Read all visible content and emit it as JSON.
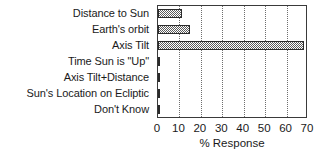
{
  "chart_data": {
    "type": "bar",
    "orientation": "horizontal",
    "title": "",
    "xlabel": "% Response",
    "ylabel": "",
    "categories": [
      "Distance to Sun",
      "Earth's orbit",
      "Axis Tilt",
      "Time Sun is \"Up\"",
      "Axis Tilt+Distance",
      "Sun's Location on Ecliptic",
      "Don't Know"
    ],
    "values": [
      11,
      15,
      68,
      0,
      0,
      0,
      0
    ],
    "xlim": [
      0,
      70
    ],
    "xticks": [
      0,
      10,
      20,
      30,
      40,
      50,
      60,
      70
    ],
    "xtick_labels": [
      "0",
      "10",
      "20",
      "30",
      "40",
      "50",
      "60",
      "70"
    ],
    "grid": "vertical-dotted",
    "legend": "none",
    "bar_fill": "#5b5b5b",
    "bar_edge": "#2b2b2b",
    "axis_color": "#3a3a3a",
    "grid_color": "#6e6e6e",
    "background": "#ffffff"
  }
}
